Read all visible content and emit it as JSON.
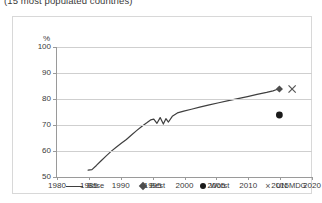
{
  "chart_data": {
    "type": "line",
    "title": "(15 most populated countries)",
    "xlabel": "",
    "ylabel": "%",
    "ylim": [
      50,
      100
    ],
    "xlim": [
      1980,
      2020
    ],
    "yticks": [
      50,
      60,
      70,
      80,
      90,
      100
    ],
    "xticks": [
      1980,
      1985,
      1990,
      1995,
      2000,
      2005,
      2010,
      2015,
      2020
    ],
    "grid": "horizontal",
    "legend_position": "bottom",
    "legend": [
      "Base",
      "Best",
      "Worst",
      "UN MDG"
    ],
    "series": [
      {
        "name": "Base",
        "marker": "none",
        "style": "line",
        "color": "#3f3f3f",
        "x": [
          1983.0,
          1983.6,
          1984.3,
          1985.0,
          1985.8,
          1986.6,
          1987.4,
          1988.2,
          1989.0,
          1989.8,
          1990.6,
          1991.4,
          1992.2,
          1992.8,
          1993.3,
          1993.8,
          1994.3,
          1994.8,
          1995.2,
          1995.6,
          1996.2,
          1997.0,
          1998.0,
          1999.2,
          2000.5,
          2002.0,
          2003.5,
          2005.0,
          2006.5,
          2008.0,
          2009.5,
          2011.0,
          2012.0,
          2012.6,
          2013.0
        ],
        "y": [
          58.8,
          59.0,
          60.6,
          62.3,
          64.2,
          66.0,
          67.6,
          69.1,
          70.6,
          72.3,
          74.0,
          75.6,
          77.0,
          78.1,
          78.4,
          76.8,
          79.0,
          76.5,
          78.6,
          77.3,
          79.5,
          80.8,
          81.5,
          82.2,
          83.0,
          83.9,
          84.7,
          85.5,
          86.3,
          87.1,
          87.9,
          88.7,
          89.3,
          89.8,
          90.1
        ]
      },
      {
        "name": "Best",
        "marker": "diamond",
        "style": "point",
        "color": "#4d4d4d",
        "x": [
          2013
        ],
        "y": [
          90
        ]
      },
      {
        "name": "Worst",
        "marker": "circle",
        "style": "point",
        "color": "#1a1a1a",
        "x": [
          2013
        ],
        "y": [
          80
        ]
      },
      {
        "name": "UN MDG",
        "marker": "cross",
        "style": "point",
        "color": "#555555",
        "x": [
          2015
        ],
        "y": [
          90
        ]
      }
    ]
  },
  "axes": {
    "y_unit": "%",
    "y_labels": [
      "100",
      "90",
      "80",
      "70",
      "60",
      "50"
    ],
    "x_labels": [
      "1980",
      "1985",
      "1990",
      "1995",
      "2000",
      "2005",
      "2010",
      "2015",
      "2020"
    ]
  },
  "legend": {
    "items": [
      {
        "label": "Base",
        "marker": "line"
      },
      {
        "label": "Best",
        "marker": "diamond"
      },
      {
        "label": "Worst",
        "marker": "circle"
      },
      {
        "label": "UN MDG",
        "marker": "cross"
      }
    ]
  },
  "icons": {
    "cross_glyph": "×"
  }
}
